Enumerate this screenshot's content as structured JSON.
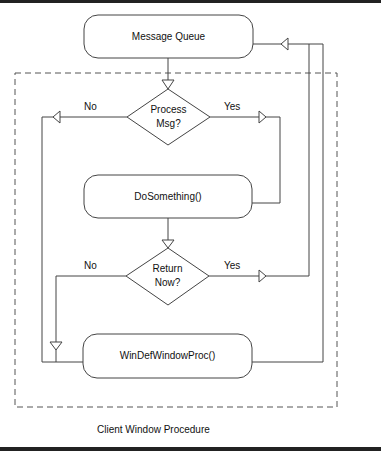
{
  "diagram": {
    "caption": "Client Window Procedure",
    "nodes": {
      "message_queue": {
        "label": "Message Queue",
        "shape": "rounded-rect"
      },
      "process_msg": {
        "label_line1": "Process",
        "label_line2": "Msg?",
        "shape": "diamond"
      },
      "do_something": {
        "label": "DoSomething()",
        "shape": "rounded-rect"
      },
      "return_now": {
        "label_line1": "Return",
        "label_line2": "Now?",
        "shape": "diamond"
      },
      "win_def_window_proc": {
        "label": "WinDefWindowProc()",
        "shape": "rounded-rect"
      }
    },
    "edges": {
      "process_no": "No",
      "process_yes": "Yes",
      "return_no": "No",
      "return_yes": "Yes"
    },
    "colors": {
      "stroke": "#444444",
      "border": "#222222",
      "dashed": "#555555"
    }
  }
}
